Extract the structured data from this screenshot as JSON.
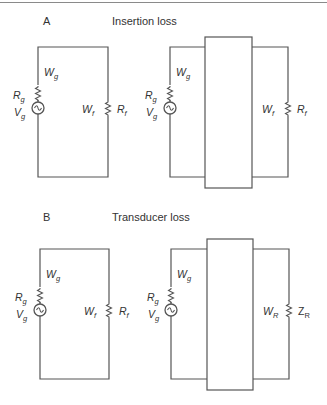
{
  "figure": {
    "panels": [
      {
        "letter": "A",
        "title": "Insertion loss",
        "left_circuit": {
          "source_power": {
            "main": "W",
            "sub": "g"
          },
          "source_resistance": {
            "main": "R",
            "sub": "g"
          },
          "source_voltage": {
            "main": "V",
            "sub": "g"
          },
          "load_power": {
            "main": "W",
            "sub": "f"
          },
          "load_resistance": {
            "main": "R",
            "sub": "f"
          }
        },
        "right_circuit": {
          "source_power": {
            "main": "W",
            "sub": "g"
          },
          "source_resistance": {
            "main": "R",
            "sub": "g"
          },
          "source_voltage": {
            "main": "V",
            "sub": "g"
          },
          "load_power": {
            "main": "W",
            "sub": "f"
          },
          "load_resistance": {
            "main": "R",
            "sub": "f"
          }
        }
      },
      {
        "letter": "B",
        "title": "Transducer loss",
        "left_circuit": {
          "source_power": {
            "main": "W",
            "sub": "g"
          },
          "source_resistance": {
            "main": "R",
            "sub": "g"
          },
          "source_voltage": {
            "main": "V",
            "sub": "g"
          },
          "load_power": {
            "main": "W",
            "sub": "f"
          },
          "load_resistance": {
            "main": "R",
            "sub": "f"
          }
        },
        "right_circuit": {
          "source_power": {
            "main": "W",
            "sub": "g"
          },
          "source_resistance": {
            "main": "R",
            "sub": "g"
          },
          "source_voltage": {
            "main": "V",
            "sub": "g"
          },
          "load_power": {
            "main": "W",
            "sub": "R"
          },
          "load_resistance": {
            "main": "Z",
            "sub": "R"
          }
        }
      }
    ]
  }
}
